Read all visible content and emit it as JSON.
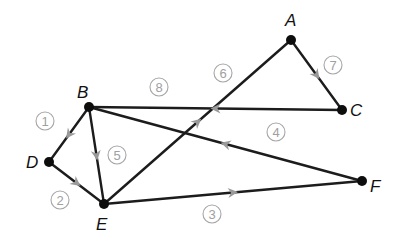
{
  "diagram": {
    "type": "directed-graph",
    "vertices": [
      {
        "id": "A",
        "label": "A",
        "x": 291,
        "y": 40,
        "lx": 285,
        "ly": 26
      },
      {
        "id": "B",
        "label": "B",
        "x": 89,
        "y": 107,
        "lx": 77,
        "ly": 98
      },
      {
        "id": "C",
        "label": "C",
        "x": 342,
        "y": 110,
        "lx": 350,
        "ly": 116
      },
      {
        "id": "D",
        "label": "D",
        "x": 49,
        "y": 162,
        "lx": 26,
        "ly": 168
      },
      {
        "id": "E",
        "label": "E",
        "x": 104,
        "y": 204,
        "lx": 96,
        "ly": 230
      },
      {
        "id": "F",
        "label": "F",
        "x": 362,
        "y": 181,
        "lx": 370,
        "ly": 192
      }
    ],
    "edges": [
      {
        "order": "1",
        "from": "B",
        "to": "D",
        "label_x": 45,
        "label_y": 121
      },
      {
        "order": "2",
        "from": "D",
        "to": "E",
        "label_x": 60,
        "label_y": 200
      },
      {
        "order": "3",
        "from": "E",
        "to": "F",
        "label_x": 212,
        "label_y": 214
      },
      {
        "order": "4",
        "from": "F",
        "to": "B",
        "label_x": 276,
        "label_y": 132
      },
      {
        "order": "5",
        "from": "B",
        "to": "E",
        "label_x": 117,
        "label_y": 155
      },
      {
        "order": "6",
        "from": "E",
        "to": "A",
        "label_x": 223,
        "label_y": 73
      },
      {
        "order": "7",
        "from": "A",
        "to": "C",
        "label_x": 333,
        "label_y": 65
      },
      {
        "order": "8",
        "from": "C",
        "to": "B",
        "label_x": 159,
        "label_y": 87
      }
    ],
    "colors": {
      "edge": "#1c1c1c",
      "vertex": "#0d0d0d",
      "arrow": "#9a9a9a",
      "edge_label": "#a0a0a0"
    }
  }
}
